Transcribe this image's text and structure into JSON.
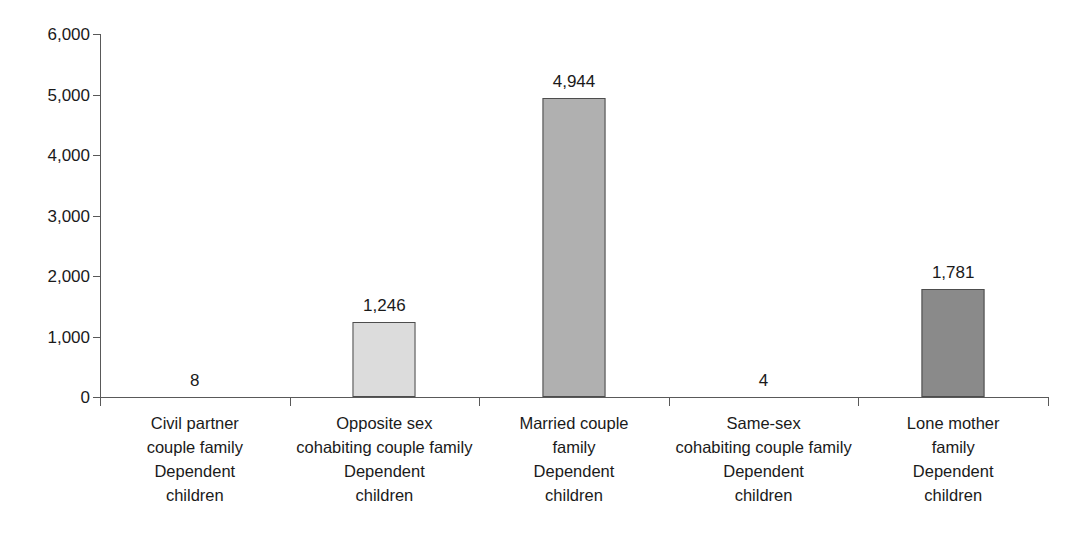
{
  "chart_data": {
    "type": "bar",
    "title": "",
    "subtitle": "",
    "xlabel": "",
    "ylabel": "",
    "ylim": [
      0,
      6000
    ],
    "grid": false,
    "legend": "none",
    "y_ticks": [
      "0",
      "1,000",
      "2,000",
      "3,000",
      "4,000",
      "5,000",
      "6,000"
    ],
    "y_tick_values": [
      0,
      1000,
      2000,
      3000,
      4000,
      5000,
      6000
    ],
    "categories": [
      "Civil partner couple family Dependent children",
      "Opposite sex cohabiting couple family Dependent children",
      "Married couple family Dependent children",
      "Same-sex cohabiting couple family Dependent children",
      "Lone mother family Dependent children"
    ],
    "category_lines": [
      [
        "Civil partner",
        "couple family",
        "Dependent",
        "children"
      ],
      [
        "Opposite sex",
        "cohabiting couple family",
        "Dependent",
        "children"
      ],
      [
        "Married couple",
        "family",
        "Dependent",
        "children"
      ],
      [
        "Same-sex",
        "cohabiting couple family",
        "Dependent",
        "children"
      ],
      [
        "Lone mother",
        "family",
        "Dependent",
        "children"
      ]
    ],
    "values": [
      8,
      1246,
      4944,
      4,
      1781
    ],
    "value_labels": [
      "8",
      "1,246",
      "4,944",
      "4",
      "1,781"
    ],
    "bar_colors": [
      "#e6e6e6",
      "#dcdcdc",
      "#b0b0b0",
      "#e6e6e6",
      "#8a8a8a"
    ],
    "bar_border_color": "#4d4d4d",
    "axis_color": "#595959",
    "text_color": "#1a1a1a",
    "background_color": "#ffffff"
  }
}
